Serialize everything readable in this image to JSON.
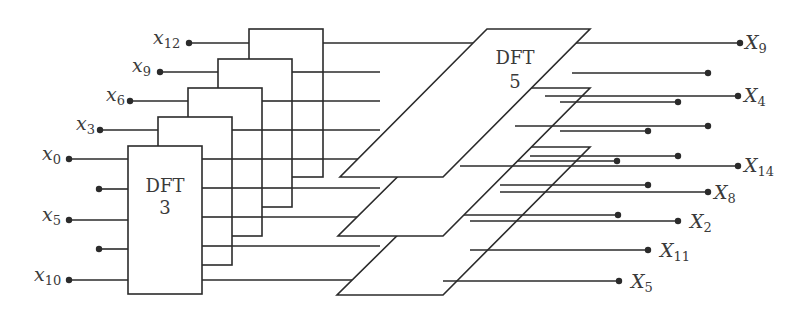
{
  "diagram": {
    "type": "DFT-15 prime-factor decomposition",
    "dft3_label": "DFT",
    "dft3_size": "3",
    "dft5_label": "DFT",
    "dft5_size": "5",
    "inputs": [
      {
        "base": "x",
        "sub": "12"
      },
      {
        "base": "x",
        "sub": "9"
      },
      {
        "base": "x",
        "sub": "6"
      },
      {
        "base": "x",
        "sub": "3"
      },
      {
        "base": "x",
        "sub": "0"
      },
      {
        "base": "x",
        "sub": "5"
      },
      {
        "base": "x",
        "sub": "10"
      }
    ],
    "outputs": [
      {
        "base": "X",
        "sub": "9"
      },
      {
        "base": "X",
        "sub": "4"
      },
      {
        "base": "X",
        "sub": "14"
      },
      {
        "base": "X",
        "sub": "8"
      },
      {
        "base": "X",
        "sub": "2"
      },
      {
        "base": "X",
        "sub": "11"
      },
      {
        "base": "X",
        "sub": "5"
      }
    ],
    "colors": {
      "stroke": "#2b2b2b",
      "text": "#3a3a3a",
      "background": "#ffffff"
    }
  }
}
